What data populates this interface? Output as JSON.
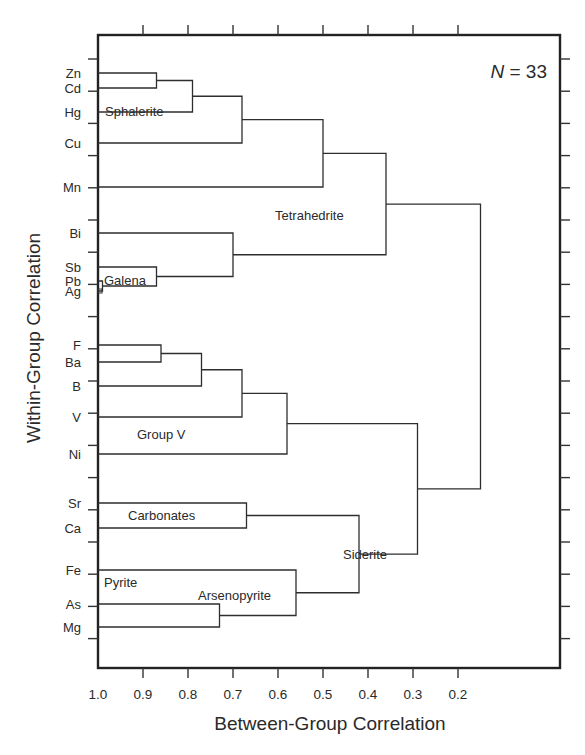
{
  "chart_data": {
    "type": "dendrogram",
    "title": "",
    "xlabel": "Between-Group Correlation",
    "ylabel": "Within-Group Correlation",
    "annotation": "N = 33",
    "annotation_parts": {
      "var": "N",
      "rest": " = 33"
    },
    "xlim": [
      1.0,
      0.1
    ],
    "x_ticks": [
      "1.0",
      "0.9",
      "0.8",
      "0.7",
      "0.6",
      "0.5",
      "0.4",
      "0.3",
      "0.2"
    ],
    "x_tick_values": [
      1.0,
      0.9,
      0.8,
      0.7,
      0.6,
      0.5,
      0.4,
      0.3,
      0.2
    ],
    "leaves": [
      "Zn",
      "Cd",
      "Hg",
      "Cu",
      "Mn",
      "Bi",
      "Sb",
      "Pb",
      "Ag",
      "F",
      "Ba",
      "B",
      "V",
      "Ni",
      "Sr",
      "Ca",
      "Fe",
      "As",
      "Mg"
    ],
    "merges": [
      {
        "id": "zn_cd",
        "children": [
          "Zn",
          "Cd"
        ],
        "correlation": 0.87
      },
      {
        "id": "sphalerite",
        "children": [
          "zn_cd",
          "Hg"
        ],
        "correlation": 0.79,
        "label": "Sphalerite"
      },
      {
        "id": "sph_cu",
        "children": [
          "sphalerite",
          "Cu"
        ],
        "correlation": 0.68
      },
      {
        "id": "sph_mn",
        "children": [
          "sph_cu",
          "Mn"
        ],
        "correlation": 0.5
      },
      {
        "id": "pb_ag",
        "children": [
          "Pb",
          "Ag"
        ],
        "correlation": 0.99
      },
      {
        "id": "galena",
        "children": [
          "Sb",
          "pb_ag"
        ],
        "correlation": 0.87,
        "label": "Galena"
      },
      {
        "id": "bi_galena",
        "children": [
          "Bi",
          "galena"
        ],
        "correlation": 0.7
      },
      {
        "id": "tetrahedrite",
        "children": [
          "sph_mn",
          "bi_galena"
        ],
        "correlation": 0.36,
        "label": "Tetrahedrite"
      },
      {
        "id": "f_ba",
        "children": [
          "F",
          "Ba"
        ],
        "correlation": 0.86
      },
      {
        "id": "fba_b",
        "children": [
          "f_ba",
          "B"
        ],
        "correlation": 0.77
      },
      {
        "id": "fbab_v",
        "children": [
          "fba_b",
          "V"
        ],
        "correlation": 0.68
      },
      {
        "id": "group_v",
        "children": [
          "fbab_v",
          "Ni"
        ],
        "correlation": 0.58,
        "label": "Group V"
      },
      {
        "id": "carbonates",
        "children": [
          "Sr",
          "Ca"
        ],
        "correlation": 0.67,
        "label": "Carbonates"
      },
      {
        "id": "as_mg",
        "children": [
          "As",
          "Mg"
        ],
        "correlation": 0.73
      },
      {
        "id": "arsenopyrite",
        "children": [
          "Fe",
          "as_mg"
        ],
        "correlation": 0.56,
        "label": "Arsenopyrite",
        "label2": "Pyrite"
      },
      {
        "id": "siderite",
        "children": [
          "carbonates",
          "arsenopyrite"
        ],
        "correlation": 0.42,
        "label": "Siderite"
      },
      {
        "id": "v_siderite",
        "children": [
          "group_v",
          "siderite"
        ],
        "correlation": 0.29
      },
      {
        "id": "root",
        "children": [
          "tetrahedrite",
          "v_siderite"
        ],
        "correlation": 0.15
      }
    ],
    "group_labels": [
      "Sphalerite",
      "Galena",
      "Tetrahedrite",
      "Group V",
      "Carbonates",
      "Pyrite",
      "Arsenopyrite",
      "Siderite"
    ],
    "grid": false,
    "legend": "none"
  }
}
